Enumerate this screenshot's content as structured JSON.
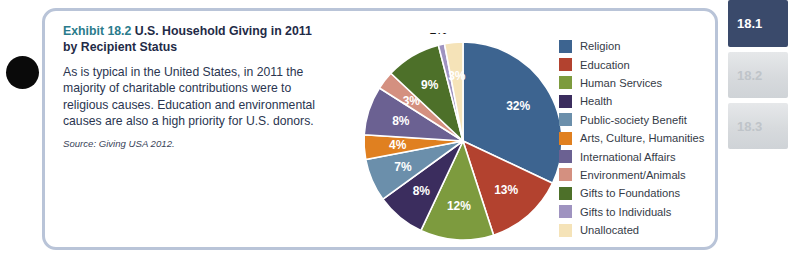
{
  "exhibit": {
    "number": "Exhibit 18.2",
    "title": "U.S. Household Giving in 2011 by Recipient Status",
    "description": "As is typical in the United States, in 2011 the majority of charitable contributions were to religious causes. Education and environmental causes are also a high priority for U.S. donors.",
    "source": "Source: Giving USA 2012."
  },
  "tabs": [
    {
      "label": "18.1",
      "state": "active"
    },
    {
      "label": "18.2",
      "state": "inactive"
    },
    {
      "label": "18.3",
      "state": "inactive"
    }
  ],
  "colors": {
    "panel_border": "#b9c4d8",
    "exhibit_number": "#2a7b8c",
    "title": "#1f2b47",
    "tab_active_bg": "#3a4a6b"
  },
  "chart_data": {
    "type": "pie",
    "title": "U.S. Household Giving in 2011 by Recipient Status",
    "categories": [
      "Religion",
      "Education",
      "Human Services",
      "Health",
      "Public-society Benefit",
      "Arts, Culture, Humanities",
      "International Affairs",
      "Environment/Animals",
      "Gifts to Foundations",
      "Gifts to Individuals",
      "Unallocated"
    ],
    "values": [
      32,
      13,
      12,
      8,
      7,
      4,
      8,
      3,
      9,
      1,
      3
    ],
    "labels": [
      "32%",
      "13%",
      "12%",
      "8%",
      "7%",
      "4%",
      "8%",
      "3%",
      "9%",
      "1%",
      "3%"
    ],
    "colors": [
      "#3d6490",
      "#b3422f",
      "#7d9b3e",
      "#3b2d5e",
      "#6b8fab",
      "#e08020",
      "#6b6192",
      "#d49080",
      "#4d7029",
      "#9f93c0",
      "#f5e3b8"
    ],
    "label_outside": [
      false,
      false,
      false,
      false,
      false,
      false,
      false,
      false,
      false,
      true,
      false
    ],
    "start_angle_deg": 0,
    "direction": "clockwise",
    "legend_position": "right",
    "unit": "percent"
  }
}
